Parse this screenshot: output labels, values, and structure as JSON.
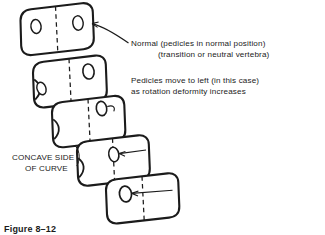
{
  "figure": {
    "caption": "Figure 8–12",
    "background_color": "#ffffff",
    "ink_color": "#1b1b1b"
  },
  "annotations": {
    "normal_line1": "Normal  (pedicles in normal position)",
    "normal_line2": "(transition or neutral vertebra)",
    "pedicles_line1": "Pedicles move to left (in this case)",
    "pedicles_line2": "as rotation deformity increases",
    "concave_line1": "CONCAVE SIDE",
    "concave_line2": "OF CURVE"
  },
  "diagram_data": {
    "type": "diagram",
    "subject": "Vertebral rotation deformity in scoliosis seen on AP view",
    "vertebra_count": 5,
    "vertebrae": [
      {
        "index": 1,
        "label": "normal / transition or neutral vertebra",
        "rotation_description": "no rotation",
        "pedicles_visible": 2,
        "pedicle_positions": "symmetric, one on each side of the midline",
        "midline": "dashed vertical",
        "tilt_degrees": -12
      },
      {
        "index": 2,
        "label": "mild rotation",
        "rotation_description": "pedicles begin to move to the left",
        "pedicles_visible": 2,
        "pedicle_positions": "both shifted left; right pedicle near midline, left pedicle at the left border",
        "midline": "dashed vertical",
        "tilt_degrees": -14
      },
      {
        "index": 3,
        "label": "moderate rotation",
        "rotation_description": "one pedicle approaches the midline",
        "pedicles_visible": 1,
        "pedicle_positions": "single oval just right of the dashed midline",
        "midline": "dashed vertical",
        "tilt_degrees": -13
      },
      {
        "index": 4,
        "label": "marked rotation",
        "rotation_description": "pedicle lies on the midline",
        "pedicles_visible": 1,
        "pedicle_positions": "oval centered on the dashed midline",
        "midline": "dashed vertical",
        "tilt_degrees": -11
      },
      {
        "index": 5,
        "label": "severe rotation",
        "rotation_description": "pedicle displaced well to the left of midline",
        "pedicles_visible": 1,
        "pedicle_positions": "oval far left of the dashed midline",
        "midline": "dashed vertical",
        "tilt_degrees": -12
      }
    ],
    "leaders": [
      {
        "from": "normal-label",
        "to": "vertebra-1-right-pedicle",
        "style": "curved with arrowhead"
      },
      {
        "from": "pedicles-label",
        "to": "vertebra-3-pedicle",
        "style": "short hooked stub"
      },
      {
        "from": "right-margin",
        "to": "vertebra-4-pedicle",
        "style": "straight arrow pointing left"
      },
      {
        "from": "right-margin",
        "to": "vertebra-5-pedicle",
        "style": "straight arrow pointing left"
      }
    ],
    "concave_side": "left"
  }
}
